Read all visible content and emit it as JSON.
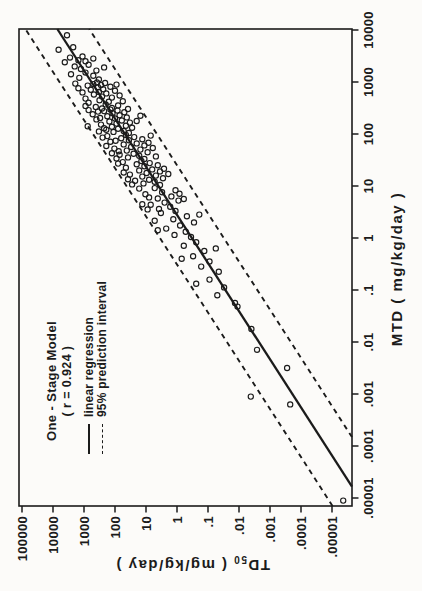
{
  "figure": {
    "legend": {
      "title": "One - Stage Model",
      "r_value_line": "( r = 0.924 )",
      "entries": [
        {
          "label": "linear regression",
          "style": "solid"
        },
        {
          "label": "95% prediction interval",
          "style": "dashed"
        }
      ]
    },
    "x_axis_title": "MTD ( mg/kg/day )",
    "y_axis_title_main": "TD",
    "y_axis_title_sub": "50",
    "y_axis_title_units": " ( mg/kg/day )",
    "ink_color": "#1b1b1b"
  },
  "chart_data": {
    "type": "scatter",
    "title": "One - Stage Model",
    "xlabel": "MTD ( mg/kg/day )",
    "ylabel": "TD50 ( mg/kg/day )",
    "x_scale": "log10",
    "y_scale": "log10",
    "x_tick_logs": [
      -5,
      -4,
      -3,
      -2,
      -1,
      0,
      1,
      2,
      3,
      4
    ],
    "x_tick_labels": [
      ".00001",
      ".0001",
      ".001",
      ".01",
      ".1",
      "1",
      "10",
      "100",
      "1000",
      "10000"
    ],
    "y_tick_logs": [
      5,
      4,
      3,
      2,
      1,
      0,
      -1,
      -2,
      -3,
      -4,
      -5
    ],
    "y_tick_labels": [
      "100000",
      "10000",
      "1000",
      "100",
      "10",
      "1",
      ".1",
      ".01",
      ".001",
      ".0001",
      ".00001"
    ],
    "legend_position": "top-left",
    "grid": false,
    "regression": {
      "slope": 1.08,
      "intercept": -0.48,
      "r": 0.924,
      "pi_offset_decades": 1.03
    },
    "points_log10": [
      [
        3.62,
        3.82
      ],
      [
        3.67,
        3.35
      ],
      [
        3.9,
        3.55
      ],
      [
        3.05,
        2.52
      ],
      [
        3.08,
        3.15
      ],
      [
        3.12,
        2.7
      ],
      [
        3.15,
        3.42
      ],
      [
        3.18,
        2.95
      ],
      [
        3.22,
        2.6
      ],
      [
        3.25,
        3.1
      ],
      [
        3.28,
        2.35
      ],
      [
        3.3,
        3.3
      ],
      [
        3.33,
        2.85
      ],
      [
        3.38,
        3.62
      ],
      [
        3.4,
        2.95
      ],
      [
        3.42,
        3.18
      ],
      [
        3.45,
        2.7
      ],
      [
        3.47,
        3.45
      ],
      [
        3.49,
        3.05
      ],
      [
        2.54,
        2.95
      ],
      [
        2.5,
        2.1
      ],
      [
        2.52,
        2.62
      ],
      [
        2.55,
        1.9
      ],
      [
        2.57,
        2.3
      ],
      [
        2.6,
        2.85
      ],
      [
        2.62,
        2.2
      ],
      [
        2.63,
        1.75
      ],
      [
        2.65,
        2.5
      ],
      [
        2.68,
        2.95
      ],
      [
        2.7,
        2.1
      ],
      [
        2.72,
        2.42
      ],
      [
        2.74,
        1.85
      ],
      [
        2.76,
        2.68
      ],
      [
        2.78,
        2.28
      ],
      [
        2.8,
        3.05
      ],
      [
        2.81,
        2.52
      ],
      [
        2.83,
        2.0
      ],
      [
        2.85,
        2.78
      ],
      [
        2.86,
        2.38
      ],
      [
        2.88,
        3.18
      ],
      [
        2.9,
        2.55
      ],
      [
        2.91,
        2.15
      ],
      [
        2.93,
        2.88
      ],
      [
        2.94,
        2.45
      ],
      [
        2.95,
        1.95
      ],
      [
        2.96,
        2.7
      ],
      [
        2.97,
        3.28
      ],
      [
        2.98,
        2.32
      ],
      [
        2.99,
        2.58
      ],
      [
        2.02,
        1.55
      ],
      [
        2.04,
        2.05
      ],
      [
        2.06,
        1.72
      ],
      [
        2.08,
        2.28
      ],
      [
        2.1,
        1.9
      ],
      [
        2.12,
        1.45
      ],
      [
        2.14,
        2.1
      ],
      [
        2.16,
        1.65
      ],
      [
        2.18,
        2.45
      ],
      [
        2.2,
        1.95
      ],
      [
        2.22,
        1.52
      ],
      [
        2.24,
        2.18
      ],
      [
        2.26,
        1.78
      ],
      [
        2.28,
        2.6
      ],
      [
        2.3,
        2.0
      ],
      [
        2.32,
        1.62
      ],
      [
        2.34,
        2.25
      ],
      [
        2.36,
        1.85
      ],
      [
        2.38,
        2.72
      ],
      [
        2.4,
        2.08
      ],
      [
        2.42,
        1.7
      ],
      [
        2.44,
        2.35
      ],
      [
        2.45,
        1.92
      ],
      [
        2.46,
        2.85
      ],
      [
        2.47,
        2.15
      ],
      [
        2.48,
        1.58
      ],
      [
        2.49,
        2.42
      ],
      [
        2.05,
        2.52
      ],
      [
        2.15,
        2.88
      ],
      [
        2.25,
        1.3
      ],
      [
        2.35,
        1.18
      ],
      [
        2.43,
        2.55
      ],
      [
        2.11,
        2.35
      ],
      [
        2.31,
        2.48
      ],
      [
        1.52,
        1.05
      ],
      [
        1.55,
        1.58
      ],
      [
        1.58,
        1.22
      ],
      [
        1.6,
        1.85
      ],
      [
        1.62,
        1.4
      ],
      [
        1.65,
        0.95
      ],
      [
        1.68,
        1.62
      ],
      [
        1.7,
        1.18
      ],
      [
        1.72,
        2.02
      ],
      [
        1.75,
        1.48
      ],
      [
        1.78,
        1.05
      ],
      [
        1.8,
        1.72
      ],
      [
        1.82,
        1.3
      ],
      [
        1.85,
        2.15
      ],
      [
        1.88,
        1.55
      ],
      [
        1.9,
        1.12
      ],
      [
        1.92,
        1.8
      ],
      [
        1.94,
        1.38
      ],
      [
        1.96,
        2.25
      ],
      [
        1.98,
        1.65
      ],
      [
        1.53,
        1.95
      ],
      [
        1.63,
        2.1
      ],
      [
        1.73,
        0.78
      ],
      [
        1.83,
        0.92
      ],
      [
        1.93,
        2.4
      ],
      [
        1.57,
        0.68
      ],
      [
        1.67,
        1.88
      ],
      [
        1.77,
        2.28
      ],
      [
        1.87,
        1.98
      ],
      [
        1.97,
        0.85
      ],
      [
        1.02,
        0.55
      ],
      [
        1.05,
        1.08
      ],
      [
        1.08,
        0.72
      ],
      [
        1.1,
        1.35
      ],
      [
        1.12,
        0.9
      ],
      [
        1.15,
        0.45
      ],
      [
        1.18,
        1.12
      ],
      [
        1.2,
        0.68
      ],
      [
        1.22,
        1.52
      ],
      [
        1.25,
        0.98
      ],
      [
        1.28,
        0.55
      ],
      [
        1.3,
        1.22
      ],
      [
        1.32,
        0.8
      ],
      [
        1.35,
        1.65
      ],
      [
        1.38,
        1.05
      ],
      [
        1.4,
        0.62
      ],
      [
        1.42,
        1.3
      ],
      [
        1.44,
        0.88
      ],
      [
        1.46,
        1.75
      ],
      [
        1.48,
        1.15
      ],
      [
        1.03,
        1.45
      ],
      [
        1.13,
        1.58
      ],
      [
        1.23,
        0.28
      ],
      [
        1.33,
        0.42
      ],
      [
        1.43,
        1.9
      ],
      [
        1.26,
        1.72
      ],
      [
        0.52,
        0.05
      ],
      [
        0.56,
        0.58
      ],
      [
        0.6,
        0.22
      ],
      [
        0.64,
        0.85
      ],
      [
        0.68,
        0.4
      ],
      [
        0.72,
        -0.05
      ],
      [
        0.76,
        0.62
      ],
      [
        0.8,
        0.18
      ],
      [
        0.84,
        1.02
      ],
      [
        0.88,
        0.48
      ],
      [
        0.92,
        0.05
      ],
      [
        0.96,
        0.72
      ],
      [
        0.55,
        0.95
      ],
      [
        0.65,
        1.12
      ],
      [
        0.75,
        -0.22
      ],
      [
        0.85,
        -0.08
      ],
      [
        0.95,
        1.22
      ],
      [
        0.78,
        0.9
      ],
      [
        0.02,
        -0.45
      ],
      [
        0.06,
        0.08
      ],
      [
        0.12,
        -0.28
      ],
      [
        0.18,
        0.35
      ],
      [
        0.24,
        -0.1
      ],
      [
        0.3,
        -0.55
      ],
      [
        0.36,
        0.12
      ],
      [
        0.42,
        -0.32
      ],
      [
        0.48,
        0.52
      ],
      [
        0.15,
        0.62
      ],
      [
        0.33,
        0.72
      ],
      [
        0.45,
        -0.72
      ],
      [
        -0.45,
        -1.05
      ],
      [
        -0.35,
        -0.52
      ],
      [
        -0.25,
        -0.88
      ],
      [
        -0.15,
        -0.22
      ],
      [
        -0.08,
        -0.62
      ],
      [
        -0.4,
        -0.15
      ],
      [
        -0.2,
        -1.25
      ],
      [
        -0.95,
        -1.52
      ],
      [
        -0.8,
        -1.05
      ],
      [
        -0.65,
        -1.35
      ],
      [
        -0.55,
        -0.78
      ],
      [
        -0.88,
        -0.62
      ],
      [
        -1.25,
        -1.87
      ],
      [
        -1.32,
        -1.95
      ],
      [
        -1.1,
        -1.3
      ],
      [
        -2.15,
        -2.58
      ],
      [
        -1.75,
        -2.4
      ],
      [
        -3.2,
        -3.65
      ],
      [
        -3.05,
        -2.38
      ],
      [
        -2.5,
        -3.55
      ],
      [
        -5.05,
        -5.36
      ]
    ]
  }
}
